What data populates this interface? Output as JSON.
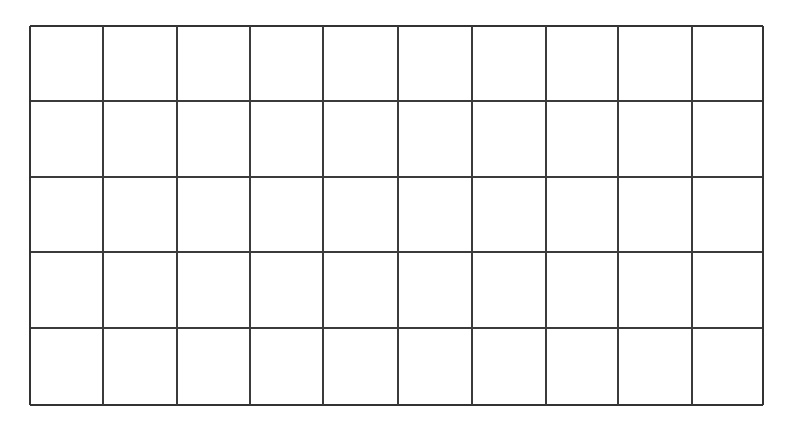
{
  "page": {
    "background_color": "#ffffff",
    "width": 785,
    "height": 421
  },
  "grid": {
    "name": "blank-grid-table",
    "description": "Empty rectangular grid of ruled cells, no text content",
    "columns": 10,
    "rows": 5,
    "cell_count": 50,
    "line_color": "#3b3b3b",
    "border_color": "#333333",
    "fill_color": "#ffffff",
    "line_width": 1.6,
    "bounds": {
      "left": 30,
      "top": 26,
      "right": 763,
      "bottom": 405,
      "width": 733,
      "height": 379
    },
    "vertical_line_positions": [
      30,
      103,
      177,
      250,
      323,
      398,
      472,
      546,
      618,
      692,
      763
    ],
    "horizontal_line_positions": [
      26,
      101,
      177,
      252,
      328,
      405
    ],
    "column_labels": [
      "",
      "",
      "",
      "",
      "",
      "",
      "",
      "",
      "",
      ""
    ],
    "row_labels": [
      "",
      "",
      "",
      "",
      ""
    ],
    "cells": [
      [
        "",
        "",
        "",
        "",
        "",
        "",
        "",
        "",
        "",
        ""
      ],
      [
        "",
        "",
        "",
        "",
        "",
        "",
        "",
        "",
        "",
        ""
      ],
      [
        "",
        "",
        "",
        "",
        "",
        "",
        "",
        "",
        "",
        ""
      ],
      [
        "",
        "",
        "",
        "",
        "",
        "",
        "",
        "",
        "",
        ""
      ],
      [
        "",
        "",
        "",
        "",
        "",
        "",
        "",
        "",
        "",
        ""
      ]
    ]
  }
}
